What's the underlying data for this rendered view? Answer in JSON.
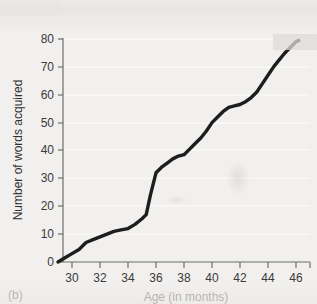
{
  "figure": {
    "panel_label": "(b)",
    "background_color": "#f1f0ee",
    "line_color": "#1d1d1d",
    "axis_color": "#6d6d6d"
  },
  "chart_data": {
    "type": "line",
    "title": "",
    "xlabel": "Age (in months)",
    "ylabel": "Number of words acquired",
    "xlim": [
      29,
      46.5
    ],
    "ylim": [
      0,
      80
    ],
    "xticks": [
      30,
      32,
      34,
      36,
      38,
      40,
      42,
      44,
      46
    ],
    "xtick_labels": [
      "30",
      "32",
      "34",
      "36",
      "38",
      "40",
      "42",
      "44",
      "46"
    ],
    "yticks": [
      0,
      10,
      20,
      30,
      40,
      50,
      60,
      70,
      80
    ],
    "ytick_labels": [
      "0",
      "10",
      "20",
      "30",
      "40",
      "50",
      "60",
      "70",
      "80"
    ],
    "grid": "horizontal",
    "legend": "none",
    "series": [
      {
        "name": "Cumulative vocabulary",
        "x": [
          29.0,
          29.5,
          30.0,
          30.5,
          31.0,
          31.5,
          32.0,
          32.5,
          33.0,
          33.5,
          34.0,
          34.5,
          35.0,
          35.3,
          35.6,
          36.0,
          36.4,
          36.8,
          37.2,
          37.6,
          38.0,
          38.4,
          38.8,
          39.2,
          39.6,
          40.0,
          40.4,
          40.8,
          41.2,
          41.6,
          42.0,
          42.4,
          42.8,
          43.2,
          43.6,
          44.0,
          44.4,
          44.8,
          45.2,
          45.6,
          46.0,
          46.2
        ],
        "y": [
          0.0,
          1.5,
          3.0,
          4.5,
          7.0,
          8.0,
          9.0,
          10.0,
          11.0,
          11.5,
          12.0,
          13.5,
          15.5,
          17.0,
          24.0,
          32.0,
          34.0,
          35.5,
          37.0,
          38.0,
          38.5,
          40.5,
          42.5,
          44.5,
          47.0,
          50.0,
          52.0,
          54.0,
          55.5,
          56.0,
          56.5,
          57.5,
          59.0,
          61.0,
          64.0,
          67.0,
          70.0,
          72.5,
          75.0,
          77.0,
          79.0,
          79.5
        ]
      }
    ]
  }
}
